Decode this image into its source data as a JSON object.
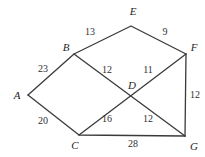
{
  "figure": {
    "background_color": "#ffffff",
    "stroke_color": "#3a3a3a",
    "label_color": "#262626"
  },
  "chart_data": {
    "type": "diagram",
    "title": "",
    "nodes": [
      {
        "id": "A",
        "label": "A",
        "x": 28,
        "y": 95,
        "label_x": 17,
        "label_y": 95
      },
      {
        "id": "B",
        "label": "B",
        "x": 74,
        "y": 54,
        "label_x": 66,
        "label_y": 47
      },
      {
        "id": "C",
        "label": "C",
        "x": 79,
        "y": 135,
        "label_x": 75,
        "label_y": 145
      },
      {
        "id": "D",
        "label": "D",
        "x": 133,
        "y": 95,
        "label_x": 132,
        "label_y": 85
      },
      {
        "id": "E",
        "label": "E",
        "x": 131,
        "y": 26,
        "label_x": 133,
        "label_y": 11
      },
      {
        "id": "F",
        "label": "F",
        "x": 186,
        "y": 54,
        "label_x": 194,
        "label_y": 47
      },
      {
        "id": "G",
        "label": "G",
        "x": 185,
        "y": 136,
        "label_x": 194,
        "label_y": 146
      }
    ],
    "edges": [
      {
        "from": "A",
        "to": "B",
        "weight": 23,
        "label_x": 43,
        "label_y": 69
      },
      {
        "from": "A",
        "to": "C",
        "weight": 20,
        "label_x": 43,
        "label_y": 121
      },
      {
        "from": "B",
        "to": "E",
        "weight": 13,
        "label_x": 90,
        "label_y": 32
      },
      {
        "from": "E",
        "to": "F",
        "weight": 9,
        "label_x": 165,
        "label_y": 32
      },
      {
        "from": "B",
        "to": "G",
        "weight": 12,
        "label_x": 107,
        "label_y": 70,
        "segment": "B-D"
      },
      {
        "from": "D",
        "to": "F",
        "weight": 11,
        "label_x": 148,
        "label_y": 70
      },
      {
        "from": "C",
        "to": "F",
        "weight": 16,
        "label_x": 107,
        "label_y": 119,
        "segment": "C-D"
      },
      {
        "from": "D",
        "to": "G",
        "weight": 12,
        "label_x": 148,
        "label_y": 119
      },
      {
        "from": "F",
        "to": "G",
        "weight": 12,
        "label_x": 195,
        "label_y": 95
      },
      {
        "from": "C",
        "to": "G",
        "weight": 28,
        "label_x": 133,
        "label_y": 144
      }
    ],
    "polylines": [
      {
        "name": "path-a-b-e-f",
        "points": "28,95 74,54 131,26 186,54"
      },
      {
        "name": "path-a-c-g",
        "points": "28,95 79,135 185,136"
      },
      {
        "name": "path-b-d-g",
        "points": "74,54 185,136"
      },
      {
        "name": "path-c-d-f",
        "points": "79,135 186,54"
      },
      {
        "name": "path-f-g",
        "points": "186,54 185,136"
      }
    ],
    "xlabel": "",
    "ylabel": ""
  }
}
